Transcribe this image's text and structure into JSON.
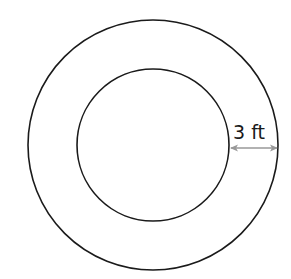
{
  "diagram": {
    "type": "concentric-circles",
    "outer_circle": {
      "cx": 153,
      "cy": 145,
      "r": 125,
      "stroke": "#1a1a1a"
    },
    "inner_circle": {
      "cx": 153,
      "cy": 145,
      "r": 76,
      "stroke": "#1a1a1a"
    },
    "dimension": {
      "label": "3 ft",
      "value": 3,
      "unit": "ft",
      "meaning": "width of ring between inner and outer circle",
      "arrow_color": "#999999"
    }
  }
}
